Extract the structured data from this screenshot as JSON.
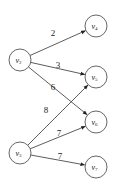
{
  "diagram": {
    "type": "directed-weighted-bipartite-graph",
    "nodes": [
      {
        "id": "v2",
        "base": "v",
        "sub": "2",
        "x": 20,
        "y": 60
      },
      {
        "id": "v3",
        "base": "v",
        "sub": "3",
        "x": 20,
        "y": 153
      },
      {
        "id": "v4",
        "base": "v",
        "sub": "4",
        "x": 96,
        "y": 26
      },
      {
        "id": "v5",
        "base": "v",
        "sub": "5",
        "x": 96,
        "y": 77
      },
      {
        "id": "v6",
        "base": "v",
        "sub": "6",
        "x": 96,
        "y": 122
      },
      {
        "id": "v7",
        "base": "v",
        "sub": "7",
        "x": 96,
        "y": 167
      }
    ],
    "edges": [
      {
        "from": "v2",
        "to": "v4",
        "weight": "2",
        "lx": 53,
        "ly": 36
      },
      {
        "from": "v2",
        "to": "v5",
        "weight": "3",
        "lx": 58,
        "ly": 68
      },
      {
        "from": "v2",
        "to": "v6",
        "weight": "6",
        "lx": 53,
        "ly": 90
      },
      {
        "from": "v3",
        "to": "v5",
        "weight": "8",
        "lx": 46,
        "ly": 113
      },
      {
        "from": "v3",
        "to": "v6",
        "weight": "7",
        "lx": 59,
        "ly": 136
      },
      {
        "from": "v3",
        "to": "v7",
        "weight": "7",
        "lx": 60,
        "ly": 159
      }
    ],
    "node_radius": 11
  }
}
